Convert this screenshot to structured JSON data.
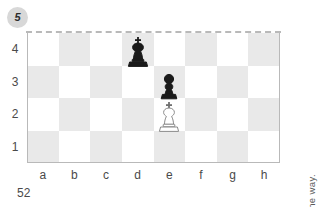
{
  "puzzle": {
    "number": "5",
    "page_number": "52",
    "clue": "CLUE: Try blocking the way."
  },
  "board": {
    "files": [
      "a",
      "b",
      "c",
      "d",
      "e",
      "f",
      "g",
      "h"
    ],
    "ranks": [
      "4",
      "3",
      "2",
      "1"
    ],
    "light_square_color": "#ffffff",
    "dark_square_color": "#e9e9e9",
    "border_color": "#b9b9b9",
    "top_edge_style": "dashed",
    "squares": [
      [
        "light",
        "dark",
        "light",
        "dark",
        "light",
        "dark",
        "light",
        "dark"
      ],
      [
        "dark",
        "light",
        "dark",
        "light",
        "dark",
        "light",
        "dark",
        "light"
      ],
      [
        "light",
        "dark",
        "light",
        "dark",
        "light",
        "dark",
        "light",
        "dark"
      ],
      [
        "dark",
        "light",
        "dark",
        "light",
        "dark",
        "light",
        "dark",
        "light"
      ]
    ]
  },
  "pieces": [
    {
      "type": "king",
      "color": "black",
      "square": "d4",
      "file": 3,
      "rank": 0,
      "label": "black-king-d4"
    },
    {
      "type": "pawn",
      "color": "black",
      "square": "e3",
      "file": 4,
      "rank": 1,
      "label": "black-pawn-e3"
    },
    {
      "type": "king",
      "color": "white",
      "square": "e2",
      "file": 4,
      "rank": 2,
      "label": "white-king-e2"
    }
  ]
}
